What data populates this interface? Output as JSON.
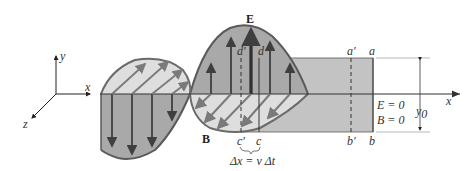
{
  "diagram": {
    "axes": {
      "x_label": "x",
      "y_label": "y",
      "z_label": "z",
      "right_x_label": "x"
    },
    "field_labels": {
      "electric": "E",
      "magnetic": "B"
    },
    "box_corners": {
      "a": "a",
      "a_prime": "a′",
      "b": "b",
      "b_prime": "b′",
      "c": "c",
      "c_prime": "c′",
      "d": "d",
      "d_prime": "d′"
    },
    "displacement": "Δx = v Δt",
    "zero_field": {
      "E": "E = 0",
      "B": "B = 0"
    },
    "height_label": "y",
    "height_subscript": "0",
    "colors": {
      "box_fill": "#c3c3c3",
      "e_wave_fill": "#a9a9a9",
      "b_wave_fill": "#dedede",
      "outline": "#5a5a5a",
      "arrow": "#3f3f3f",
      "b_arrow": "#7a7a7a"
    }
  }
}
